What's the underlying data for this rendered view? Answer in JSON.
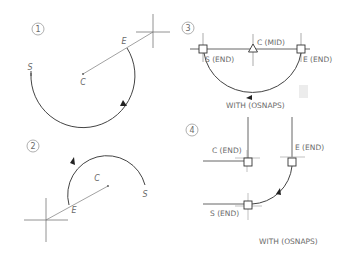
{
  "panels": [
    {
      "number": "1",
      "labels": {
        "start": "S",
        "center": "C",
        "end": "E"
      }
    },
    {
      "number": "2",
      "labels": {
        "start": "S",
        "center": "C",
        "end": "E"
      }
    },
    {
      "number": "3",
      "labels": {
        "start": "S (END)",
        "center": "C (MID)",
        "end": "E (END)",
        "caption": "WITH (OSNAPS)"
      }
    },
    {
      "number": "4",
      "labels": {
        "start": "S (END)",
        "center": "C (END)",
        "end": "E (END)",
        "caption": "WITH (OSNAPS)"
      }
    }
  ],
  "colors": {
    "line": "#444444",
    "construction": "#8a8a8a",
    "text": "#6a6a6a"
  }
}
